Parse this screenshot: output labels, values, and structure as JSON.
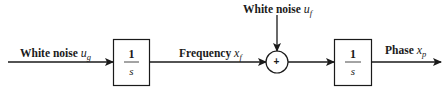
{
  "diagram": {
    "type": "block-diagram",
    "inputs": {
      "main": {
        "text": "White noise ",
        "var": "u",
        "sub": "g"
      },
      "top": {
        "text": "White noise ",
        "var": "u",
        "sub": "f"
      }
    },
    "blocks": [
      {
        "id": "integrator-1",
        "numerator": "1",
        "denominator": "s"
      },
      {
        "id": "integrator-2",
        "numerator": "1",
        "denominator": "s"
      }
    ],
    "signals": {
      "frequency": {
        "text": "Frequency ",
        "var": "x",
        "sub": "f"
      },
      "phase": {
        "text": "Phase ",
        "var": "x",
        "sub": "p"
      }
    },
    "summing_junction": {
      "symbol": "+"
    },
    "colors": {
      "stroke": "#1a1a1a",
      "background": "#ffffff"
    }
  }
}
